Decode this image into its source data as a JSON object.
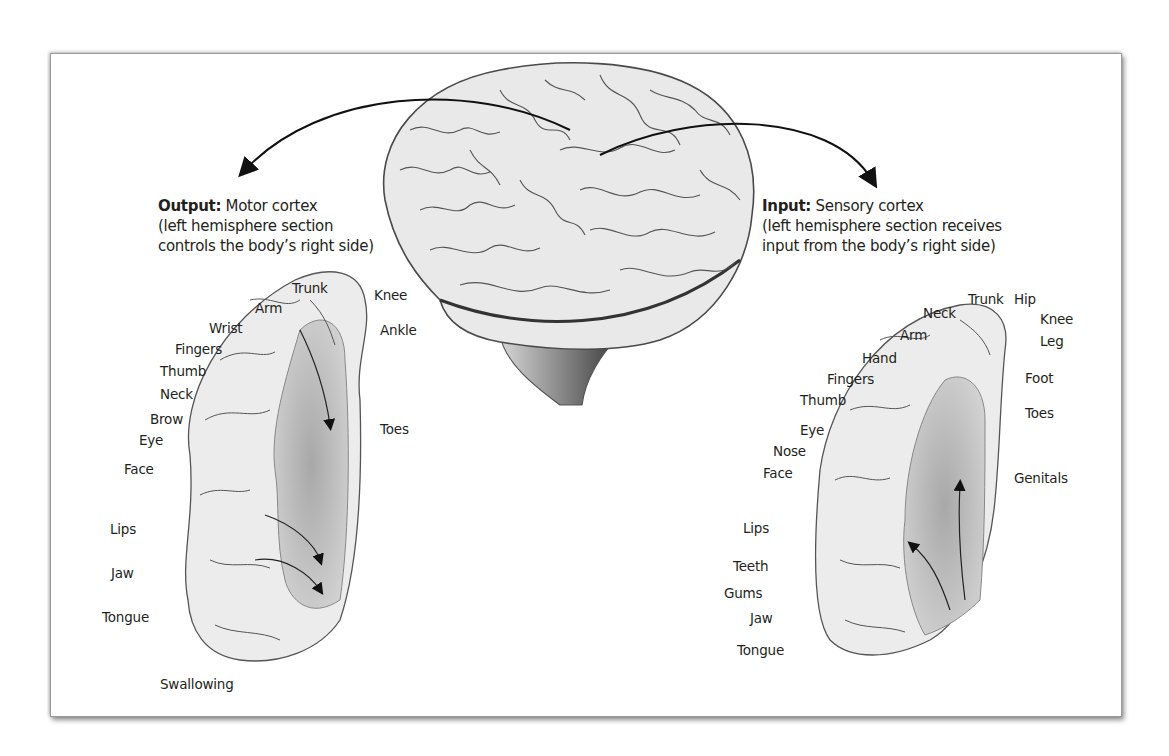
{
  "figure": {
    "output_caption": {
      "bold": "Output:",
      "title": " Motor cortex",
      "line2": "(left hemisphere section",
      "line3": "controls the body’s right side)"
    },
    "input_caption": {
      "bold": "Input:",
      "title": " Sensory cortex",
      "line2": "(left hemisphere section receives",
      "line3": "input from the body’s right side)"
    },
    "motor_labels": [
      "Trunk",
      "Knee",
      "Arm",
      "Ankle",
      "Wrist",
      "Fingers",
      "Thumb",
      "Neck",
      "Toes",
      "Brow",
      "Eye",
      "Face",
      "Lips",
      "Jaw",
      "Tongue",
      "Swallowing"
    ],
    "sensory_labels": [
      "Trunk",
      "Hip",
      "Neck",
      "Knee",
      "Arm",
      "Leg",
      "Hand",
      "Foot",
      "Fingers",
      "Thumb",
      "Toes",
      "Eye",
      "Nose",
      "Face",
      "Genitals",
      "Lips",
      "Teeth",
      "Gums",
      "Jaw",
      "Tongue"
    ],
    "colors": {
      "cortex_fill": "#ececec",
      "cortex_inner": "#b8b8b8",
      "outline": "#4a4a4a",
      "frame_shadow": "#9a9a9a"
    }
  }
}
